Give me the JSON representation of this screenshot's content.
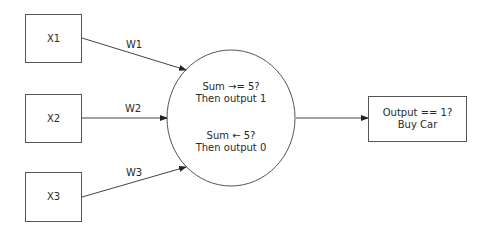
{
  "diagram": {
    "inputs": [
      {
        "id": "x1",
        "label": "X1"
      },
      {
        "id": "x2",
        "label": "X2"
      },
      {
        "id": "x3",
        "label": "X3"
      }
    ],
    "weights": [
      {
        "id": "w1",
        "label": "W1"
      },
      {
        "id": "w2",
        "label": "W2"
      },
      {
        "id": "w3",
        "label": "W3"
      }
    ],
    "neuron": {
      "rule1_line1": "Sum →= 5?",
      "rule1_line2": "Then output 1",
      "rule2_line1": "Sum ← 5?",
      "rule2_line2": "Then output 0"
    },
    "output": {
      "line1": "Output == 1?",
      "line2": "Buy Car"
    },
    "colors": {
      "stroke": "#555555",
      "text": "#2a2a2a",
      "background": "#ffffff"
    }
  }
}
